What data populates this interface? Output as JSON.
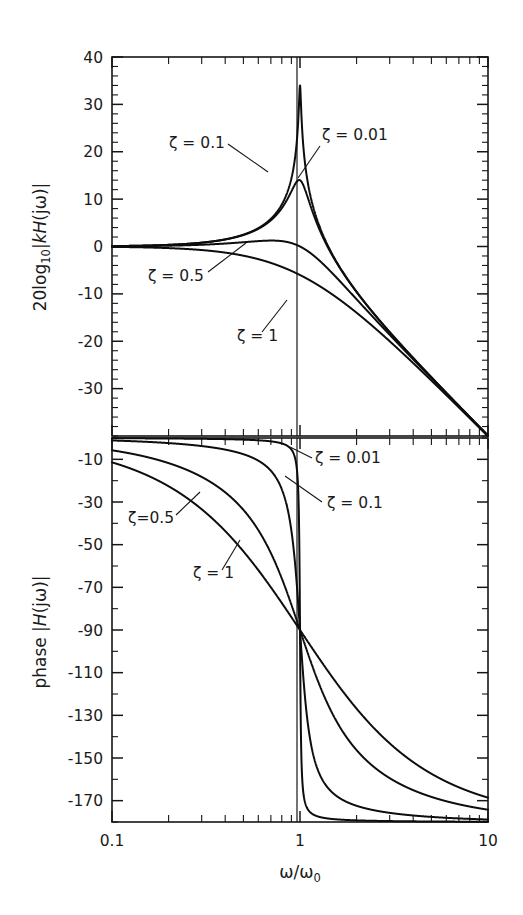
{
  "figure": {
    "kind": "bode-plot",
    "background_color": "#ffffff",
    "line_color": "#0d0d0d"
  },
  "axes": {
    "x": {
      "label_parts": {
        "omega": "ω",
        "slash": "/",
        "omega2": "ω",
        "subscript": "0"
      },
      "label": "ω/ω₀",
      "scale": "log",
      "min": 0.1,
      "max": 10,
      "tick_labels": [
        "0.1",
        "1",
        "10"
      ],
      "tick_values": [
        0.1,
        1,
        10
      ],
      "minor_ticks": [
        0.2,
        0.3,
        0.4,
        0.5,
        0.6,
        0.7,
        0.8,
        0.9,
        2,
        3,
        4,
        5,
        6,
        7,
        8,
        9
      ]
    },
    "magnitude_y": {
      "label": "20log₁₀|kH(jω)|",
      "label_parts": {
        "lead": "20log",
        "sub": "10",
        "bar": "|",
        "k": "k",
        "H": "H",
        "arg": "(jω)"
      },
      "min": -40,
      "max": 40,
      "tick_labels": [
        "40",
        "30",
        "20",
        "10",
        "0",
        "-10",
        "-20",
        "-30"
      ],
      "tick_values": [
        40,
        30,
        20,
        10,
        0,
        -10,
        -20,
        -30
      ],
      "minor_step": 2,
      "units": "dB"
    },
    "phase_y": {
      "label": "phase |H(jω)|",
      "label_parts": {
        "lead": "phase ",
        "bar": "|",
        "H": "H",
        "arg": "(jω)"
      },
      "min": -180,
      "max": 0,
      "tick_labels": [
        "-10",
        "-30",
        "-50",
        "-70",
        "-90",
        "-110",
        "-130",
        "-150",
        "-170"
      ],
      "tick_values": [
        -10,
        -30,
        -50,
        -70,
        -90,
        -110,
        -130,
        -150,
        -170
      ],
      "minor_step": 10,
      "units": "degrees"
    }
  },
  "annotations": {
    "magnitude": [
      {
        "text": "ζ = 0.1",
        "x": 169,
        "y": 148,
        "leader": [
          [
            228,
            144
          ],
          [
            268,
            172
          ]
        ]
      },
      {
        "text": "ζ = 0.01",
        "x": 322,
        "y": 140,
        "leader": [
          [
            320,
            146
          ],
          [
            298,
            178
          ]
        ]
      },
      {
        "text": "ζ = 0.5",
        "x": 148,
        "y": 281,
        "leader": [
          [
            208,
            272
          ],
          [
            246,
            243
          ]
        ]
      },
      {
        "text": "ζ = 1",
        "x": 237,
        "y": 341,
        "leader": [
          [
            262,
            332
          ],
          [
            287,
            300
          ]
        ]
      }
    ],
    "phase": [
      {
        "text": "ζ = 0.01",
        "x": 315,
        "y": 463,
        "leader": [
          [
            312,
            458
          ],
          [
            290,
            447
          ]
        ]
      },
      {
        "text": "ζ = 0.1",
        "x": 327,
        "y": 508,
        "leader": [
          [
            322,
            502
          ],
          [
            285,
            476
          ]
        ]
      },
      {
        "text": "ζ=0.5",
        "x": 128,
        "y": 523,
        "leader": [
          [
            176,
            515
          ],
          [
            200,
            492
          ]
        ]
      },
      {
        "text": "ζ = 1",
        "x": 193,
        "y": 578,
        "leader": [
          [
            222,
            570
          ],
          [
            240,
            540
          ]
        ]
      }
    ]
  },
  "chart_data": {
    "type": "line",
    "title": "",
    "subtitle": "",
    "xlabel": "ω/ω₀",
    "xscale": "log",
    "xlim": [
      0.1,
      10
    ],
    "xticks": [
      0.1,
      1,
      10
    ],
    "xticklabels": [
      "0.1",
      "1",
      "10"
    ],
    "grid": false,
    "legend": "inline-annotations",
    "panels": [
      {
        "name": "magnitude",
        "ylabel": "20log₁₀|kH(jω)|",
        "ylim": [
          -40,
          40
        ],
        "yticks": [
          40,
          30,
          20,
          10,
          0,
          -10,
          -20,
          -30
        ],
        "yticklabels": [
          "40",
          "30",
          "20",
          "10",
          "0",
          "-10",
          "-20",
          "-30"
        ],
        "series": [
          {
            "name": "ζ = 0.01",
            "zeta": 0.01,
            "peak_db": 34.0,
            "value_at_0p1": 0.0,
            "value_at_1": 34.0,
            "value_at_10": -40.0
          },
          {
            "name": "ζ = 0.1",
            "zeta": 0.1,
            "peak_db": 14.0,
            "value_at_0p1": 0.0,
            "value_at_1": 14.0,
            "value_at_10": -40.0
          },
          {
            "name": "ζ = 0.5",
            "zeta": 0.5,
            "peak_db": 1.25,
            "value_at_0p1": 0.0,
            "value_at_1": 0.0,
            "value_at_10": -40.1
          },
          {
            "name": "ζ = 1",
            "zeta": 1.0,
            "peak_db": 0.0,
            "value_at_0p1": -0.09,
            "value_at_1": -6.0,
            "value_at_10": -40.2
          }
        ]
      },
      {
        "name": "phase",
        "ylabel": "phase |H(jω)|",
        "ylim": [
          -180,
          0
        ],
        "yticks": [
          -10,
          -30,
          -50,
          -70,
          -90,
          -110,
          -130,
          -150,
          -170
        ],
        "yticklabels": [
          "-10",
          "-30",
          "-50",
          "-70",
          "-90",
          "-110",
          "-130",
          "-150",
          "-170"
        ],
        "series": [
          {
            "name": "ζ = 0.01",
            "zeta": 0.01,
            "value_at_0p1": -0.1,
            "value_at_1": -90,
            "value_at_10": -179.9
          },
          {
            "name": "ζ = 0.1",
            "zeta": 0.1,
            "value_at_0p1": -1.2,
            "value_at_1": -90,
            "value_at_10": -178.8
          },
          {
            "name": "ζ = 0.5",
            "zeta": 0.5,
            "value_at_0p1": -5.8,
            "value_at_1": -90,
            "value_at_10": -174.2
          },
          {
            "name": "ζ = 1",
            "zeta": 1.0,
            "value_at_0p1": -11.4,
            "value_at_1": -90,
            "value_at_10": -168.6
          }
        ]
      }
    ]
  },
  "geometry": {
    "magnitude_plot": {
      "left": 112,
      "right": 488,
      "top": 57,
      "bottom": 436
    },
    "phase_plot": {
      "left": 112,
      "right": 488,
      "top": 438,
      "bottom": 822
    },
    "resonance_vline_x": 297
  }
}
